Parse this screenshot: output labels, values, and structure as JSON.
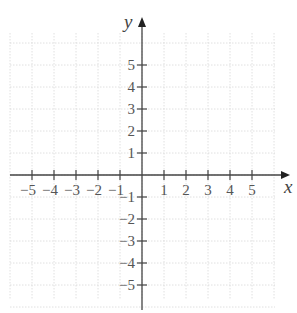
{
  "chart_data": {
    "type": "scatter",
    "title": "",
    "xlabel": "x",
    "ylabel": "y",
    "xlim": [
      -6,
      6
    ],
    "ylim": [
      -6,
      6
    ],
    "grid": true,
    "grid_style": "dotted",
    "x_ticks": [
      -5,
      -4,
      -3,
      -2,
      -1,
      1,
      2,
      3,
      4,
      5
    ],
    "x_tick_labels": [
      "−5",
      "−4",
      "−3",
      "−2",
      "−1",
      "1",
      "2",
      "3",
      "4",
      "5"
    ],
    "y_ticks": [
      5,
      4,
      3,
      2,
      1,
      -1,
      -2,
      -3,
      -4,
      -5
    ],
    "y_tick_labels": [
      "5",
      "4",
      "3",
      "2",
      "1",
      "−1",
      "−2",
      "−3",
      "−4",
      "−5"
    ],
    "series": [],
    "legend": null
  },
  "colors": {
    "axis": "#444444",
    "grid": "#d8d8d8",
    "label": "#555555"
  }
}
